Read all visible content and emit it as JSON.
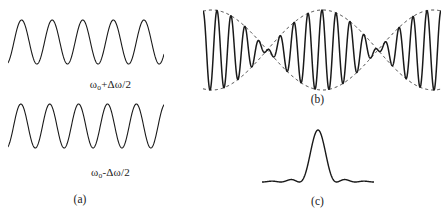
{
  "figure": {
    "width": 442,
    "height": 221,
    "background_color": "#ffffff",
    "stroke_color": "#1a1a1a"
  },
  "panel_a": {
    "label": "(a)",
    "wave_top": {
      "name": "sinusoid-higher-frequency",
      "equation_label_html": "ω<sub>o</sub>+Δω/2",
      "equation_label_text": "ωo+Δω/2",
      "cycles": 5.1,
      "amplitude": 22,
      "phase_deg": 200
    },
    "wave_bottom": {
      "name": "sinusoid-lower-frequency",
      "equation_label_html": "ω<sub>o</sub>-Δω/2",
      "equation_label_text": "ωo-Δω/2",
      "cycles": 5.4,
      "amplitude": 22,
      "phase_deg": 200
    }
  },
  "panel_b": {
    "label": "(b)",
    "name": "beat-waveform-with-envelope",
    "carrier_cycles": 17,
    "beat_cycles": 2.15,
    "amplitude": 40,
    "envelope_style": "dashed",
    "envelope_dash": "3,3"
  },
  "panel_c": {
    "label": "(c)",
    "name": "sinc-pulse",
    "peak_height": 52,
    "side_lobe_height": 7,
    "lobe_half_width": 14
  },
  "chart_data": {
    "type": "line",
    "title": "",
    "subtitle": "",
    "xlabel": "",
    "ylabel": "",
    "grid": false,
    "legend": "none",
    "series": [
      {
        "name": "ωo+Δω/2",
        "panel": "a",
        "form": "cos",
        "frequency_cycles": 5.1,
        "amplitude": 22,
        "phase_deg": 200
      },
      {
        "name": "ωo-Δω/2",
        "panel": "a",
        "form": "cos",
        "frequency_cycles": 5.4,
        "amplitude": 22,
        "phase_deg": 200
      },
      {
        "name": "sum-beat",
        "panel": "b",
        "form": "cos(carrier)*cos(envelope)",
        "carrier_cycles": 17,
        "beat_cycles": 2.15,
        "amplitude": 40
      },
      {
        "name": "envelope-upper",
        "panel": "b",
        "form": "abs-cos-envelope",
        "style": "dashed",
        "amplitude": 40
      },
      {
        "name": "envelope-lower",
        "panel": "b",
        "form": "abs-cos-envelope-negative",
        "style": "dashed",
        "amplitude": -40
      },
      {
        "name": "pulse",
        "panel": "c",
        "form": "sinc-squared",
        "peak": 52
      }
    ]
  }
}
